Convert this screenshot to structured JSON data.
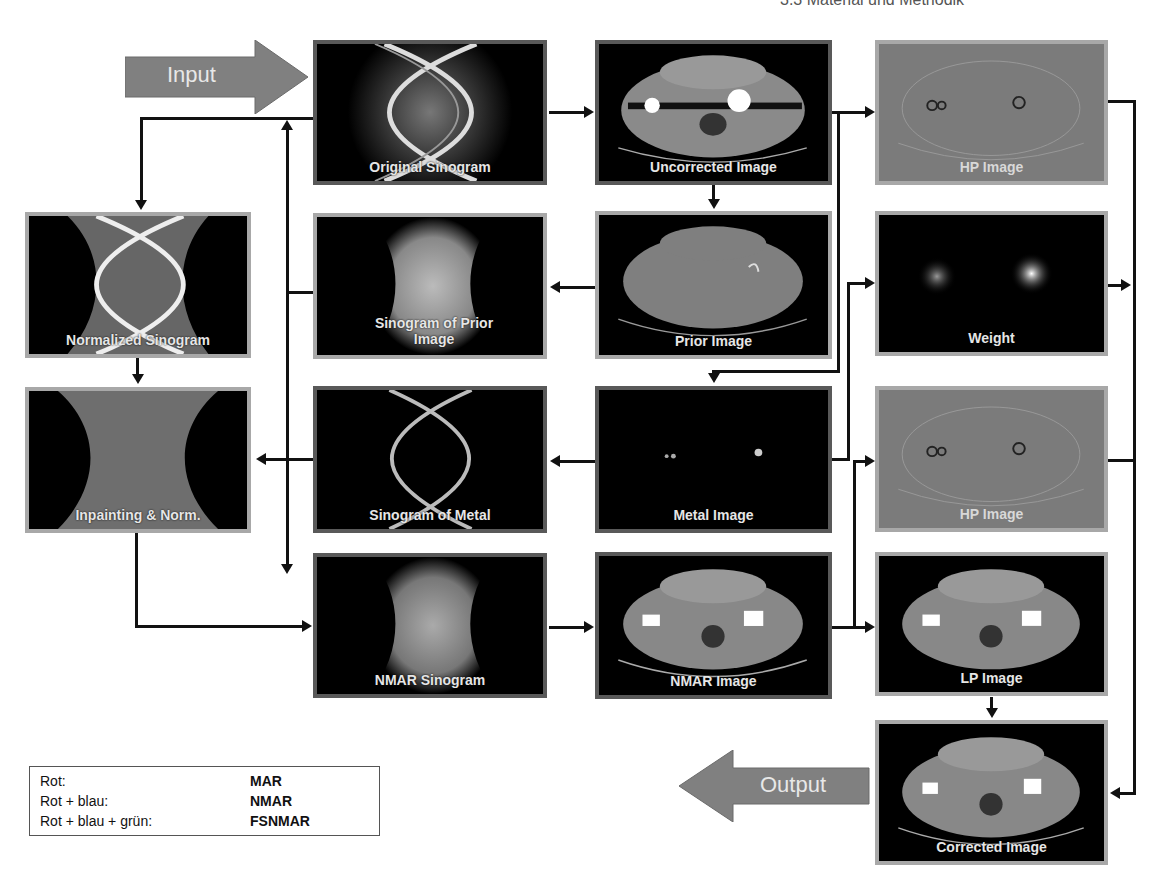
{
  "header": {
    "title": "3.3  Material und Methodik"
  },
  "flow_arrows": {
    "input_label": "Input",
    "output_label": "Output",
    "color": "#808080"
  },
  "panels": {
    "original_sinogram": "Original Sinogram",
    "uncorrected_image": "Uncorrected Image",
    "hp_image_1": "HP Image",
    "normalized_sinogram": "Normalized Sinogram",
    "sinogram_prior": "Sinogram of Prior Image",
    "prior_image": "Prior Image",
    "weight": "Weight",
    "inpainting_norm": "Inpainting & Norm.",
    "sinogram_metal": "Sinogram of Metal",
    "metal_image": "Metal Image",
    "hp_image_2": "HP Image",
    "nmar_sinogram": "NMAR Sinogram",
    "nmar_image": "NMAR Image",
    "lp_image": "LP Image",
    "corrected_image": "Corrected Image"
  },
  "legend": {
    "rows": [
      {
        "key": "Rot:",
        "value": "MAR"
      },
      {
        "key": "Rot + blau:",
        "value": "NMAR"
      },
      {
        "key": "Rot + blau + grün:",
        "value": "FSNMAR"
      }
    ]
  },
  "colors": {
    "border_dark": "#595959",
    "border_light": "#a8a8a8",
    "connector": "#111111",
    "hp_background": "#7b7b7b"
  }
}
